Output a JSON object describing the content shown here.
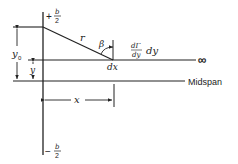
{
  "figure": {
    "labels": {
      "top_bound_sign": "+",
      "top_bound_num": "b",
      "top_bound_den": "2",
      "bottom_bound_sign": "−",
      "bottom_bound_num": "b",
      "bottom_bound_den": "2",
      "r": "r",
      "beta": "β",
      "dgamma_num": "dΓ",
      "dgamma_den": "dy",
      "dy": "dy",
      "dx": "dx",
      "infinity": "∞",
      "midspan": "Midspan",
      "y0": "y",
      "y0_sub": "0",
      "y": "y",
      "x": "x"
    },
    "colors": {
      "line": "#222222",
      "background": "#ffffff"
    }
  }
}
